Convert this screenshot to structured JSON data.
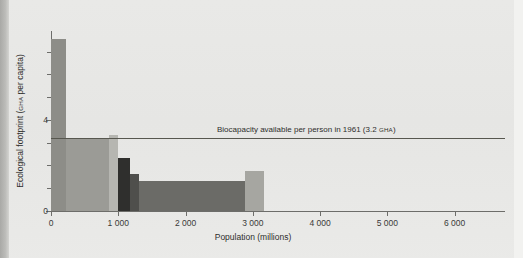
{
  "figure": {
    "top_caption": "",
    "y_axis_title_main": "Ecological footprint (",
    "y_axis_title_unit": "GHA",
    "y_axis_title_tail": " per capita)",
    "x_axis_title": "Population (millions)"
  },
  "annotation": {
    "text_main": "Biocapacity available per person in 1961 (3.2 ",
    "text_unit": "GHA",
    "text_tail": ")",
    "value": 3.2,
    "line_color": "#57574f"
  },
  "chart_data": {
    "type": "bar",
    "title": "",
    "xlabel": "Population (millions)",
    "ylabel": "Ecological footprint (gha per capita)",
    "xlim": [
      0,
      6750
    ],
    "ylim": [
      0,
      7.9
    ],
    "grid": false,
    "legend": "none",
    "x_ticks": [
      0,
      1000,
      2000,
      3000,
      4000,
      5000,
      6000
    ],
    "x_tick_labels": [
      "0",
      "1 000",
      "2 000",
      "3 000",
      "4 000",
      "5 000",
      "6 000"
    ],
    "y_ticks": [
      0,
      1,
      2,
      3,
      4,
      5,
      6,
      7
    ],
    "y_tick_labels": [
      "0",
      "",
      "",
      "",
      "4",
      "",
      "",
      ""
    ],
    "y_major_ticks": [
      0,
      4
    ],
    "bars": [
      {
        "name": "band-1",
        "x_start": 0,
        "x_end": 230,
        "height": 7.55,
        "color": "#8d8d88"
      },
      {
        "name": "band-2",
        "x_start": 230,
        "x_end": 855,
        "height": 3.22,
        "color": "#9b9b96"
      },
      {
        "name": "band-3",
        "x_start": 855,
        "x_end": 1000,
        "height": 3.32,
        "color": "#b6b6b1"
      },
      {
        "name": "band-4",
        "x_start": 1000,
        "x_end": 1180,
        "height": 2.32,
        "color": "#2f2f2d"
      },
      {
        "name": "band-5",
        "x_start": 1180,
        "x_end": 1310,
        "height": 1.63,
        "color": "#4f4f4c"
      },
      {
        "name": "band-6",
        "x_start": 1310,
        "x_end": 2880,
        "height": 1.3,
        "color": "#6b6b67"
      },
      {
        "name": "band-7",
        "x_start": 2880,
        "x_end": 3160,
        "height": 1.75,
        "color": "#a6a6a1"
      }
    ],
    "reference_lines": [
      {
        "name": "biocapacity-1961",
        "y": 3.2,
        "label": "Biocapacity available per person in 1961 (3.2 GHA)"
      }
    ]
  }
}
